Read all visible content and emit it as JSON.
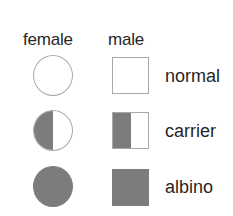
{
  "legend": {
    "columns": {
      "female": "female",
      "male": "male"
    },
    "rows": [
      {
        "label": "normal",
        "fill": "none"
      },
      {
        "label": "carrier",
        "fill": "half"
      },
      {
        "label": "albino",
        "fill": "full"
      }
    ],
    "colors": {
      "fill": "#7c7c7c",
      "outline": "#a8a8a8",
      "background": "#ffffff",
      "text": "#262626"
    }
  }
}
